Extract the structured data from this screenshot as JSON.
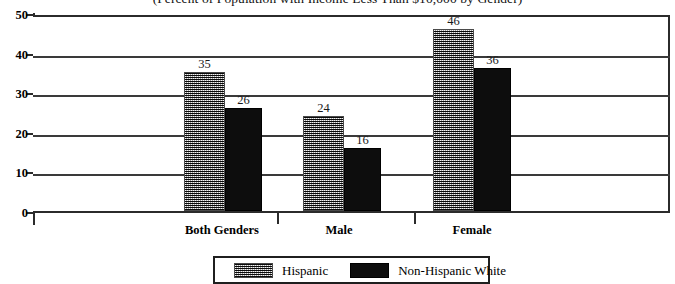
{
  "chart_data": {
    "type": "bar",
    "title": "(Percent of Population with Income Less Than $10,000 by Gender)",
    "xlabel": "",
    "ylabel": "",
    "ylim": [
      0,
      50
    ],
    "yticks": [
      0,
      10,
      20,
      30,
      40,
      50
    ],
    "ytick_labels": [
      "0",
      "10",
      "20",
      "30",
      "40",
      "50"
    ],
    "grid": true,
    "grid_axis": "y",
    "legend_position": "bottom-center",
    "categories": [
      "Both Genders",
      "Male",
      "Female"
    ],
    "series": [
      {
        "name": "Hispanic",
        "values": [
          35,
          24,
          46
        ],
        "value_labels": [
          "35",
          "24",
          "46"
        ],
        "fill": "checkered-gray",
        "color": "#9a9a9a"
      },
      {
        "name": "Non-Hispanic White",
        "values": [
          26,
          16,
          36
        ],
        "value_labels": [
          "26",
          "16",
          "36"
        ],
        "fill": "solid",
        "color": "#0d0d0d"
      }
    ]
  },
  "legend": {
    "items": [
      {
        "label": "Hispanic"
      },
      {
        "label": "Non-Hispanic White"
      }
    ]
  }
}
